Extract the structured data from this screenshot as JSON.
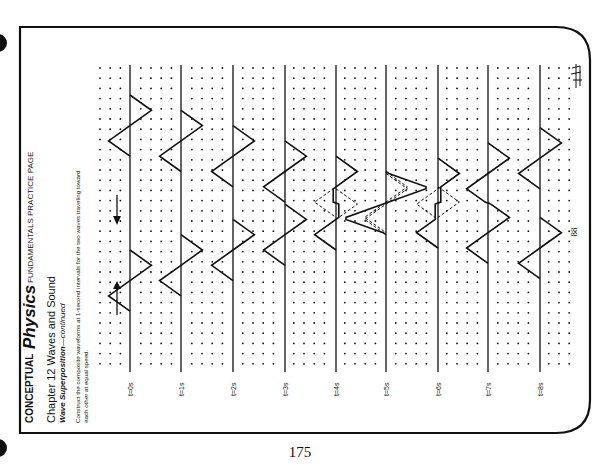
{
  "header": {
    "brand_word1": "CONCEPTUAL",
    "brand_word2": "Physics",
    "brand_tag": "FUNDAMENTALS PRACTICE PAGE",
    "chapter": "Chapter 12  Waves and Sound",
    "section": "Wave Superposition",
    "section_suffix": "—continued",
    "instructions_line1": "Construct the composite waveforms at 1-second intervals for the two waves traveling toward",
    "instructions_line2": "each other at equal speed."
  },
  "panels": [
    {
      "label": "t=0s"
    },
    {
      "label": "t=1s"
    },
    {
      "label": "t=2s"
    },
    {
      "label": "t=3s"
    },
    {
      "label": "t=4s"
    },
    {
      "label": "t=5s"
    },
    {
      "label": "t=6s"
    },
    {
      "label": "t=7s"
    },
    {
      "label": "t=8s"
    }
  ],
  "inner_page_number": "88",
  "page_number": "175",
  "colors": {
    "ink": "#111111",
    "paper": "#ffffff"
  }
}
